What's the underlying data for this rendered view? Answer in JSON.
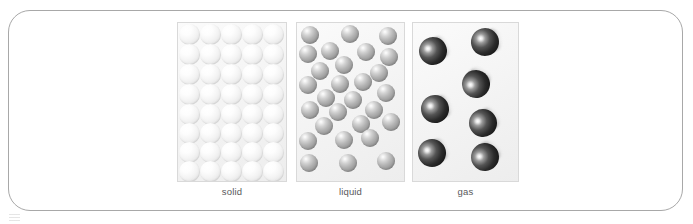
{
  "figure": {
    "frame": {
      "border_color": "#a8a8a8",
      "background_color": "#ffffff",
      "corner_radius_px": 22
    }
  },
  "panels": [
    {
      "id": "solid",
      "label": "solid",
      "state": "solid",
      "particle_color": "#ededed",
      "particle_count": 40,
      "arrangement": "regular close-packed lattice, 5 columns by 8 rows",
      "particle_diameter_px": 21,
      "motion": "vibrating in fixed positions",
      "particles": [
        {
          "x": 1,
          "y": 1
        },
        {
          "x": 22,
          "y": 1
        },
        {
          "x": 43,
          "y": 1
        },
        {
          "x": 64,
          "y": 1
        },
        {
          "x": 85,
          "y": 1
        },
        {
          "x": 1,
          "y": 21
        },
        {
          "x": 22,
          "y": 21
        },
        {
          "x": 43,
          "y": 21
        },
        {
          "x": 64,
          "y": 21
        },
        {
          "x": 85,
          "y": 21
        },
        {
          "x": 1,
          "y": 41
        },
        {
          "x": 22,
          "y": 41
        },
        {
          "x": 43,
          "y": 41
        },
        {
          "x": 64,
          "y": 41
        },
        {
          "x": 85,
          "y": 41
        },
        {
          "x": 1,
          "y": 61
        },
        {
          "x": 22,
          "y": 61
        },
        {
          "x": 43,
          "y": 61
        },
        {
          "x": 64,
          "y": 61
        },
        {
          "x": 85,
          "y": 61
        },
        {
          "x": 1,
          "y": 81
        },
        {
          "x": 22,
          "y": 81
        },
        {
          "x": 43,
          "y": 81
        },
        {
          "x": 64,
          "y": 81
        },
        {
          "x": 85,
          "y": 81
        },
        {
          "x": 1,
          "y": 100
        },
        {
          "x": 22,
          "y": 100
        },
        {
          "x": 43,
          "y": 100
        },
        {
          "x": 64,
          "y": 100
        },
        {
          "x": 85,
          "y": 100
        },
        {
          "x": 1,
          "y": 119
        },
        {
          "x": 22,
          "y": 119
        },
        {
          "x": 43,
          "y": 119
        },
        {
          "x": 64,
          "y": 119
        },
        {
          "x": 85,
          "y": 119
        },
        {
          "x": 1,
          "y": 138
        },
        {
          "x": 22,
          "y": 138
        },
        {
          "x": 43,
          "y": 138
        },
        {
          "x": 64,
          "y": 138
        },
        {
          "x": 85,
          "y": 138
        }
      ]
    },
    {
      "id": "liquid",
      "label": "liquid",
      "state": "liquid",
      "particle_color": "#a0a0a0",
      "particle_count": 28,
      "arrangement": "close together but irregular and disordered",
      "particle_diameter_px": 18,
      "motion": "sliding past one another",
      "particles": [
        {
          "x": 4,
          "y": 3
        },
        {
          "x": 44,
          "y": 2
        },
        {
          "x": 82,
          "y": 4
        },
        {
          "x": 2,
          "y": 22
        },
        {
          "x": 24,
          "y": 19
        },
        {
          "x": 60,
          "y": 20
        },
        {
          "x": 83,
          "y": 25
        },
        {
          "x": 38,
          "y": 33
        },
        {
          "x": 14,
          "y": 39
        },
        {
          "x": 73,
          "y": 41
        },
        {
          "x": 2,
          "y": 53
        },
        {
          "x": 34,
          "y": 52
        },
        {
          "x": 57,
          "y": 50
        },
        {
          "x": 20,
          "y": 66
        },
        {
          "x": 80,
          "y": 61
        },
        {
          "x": 47,
          "y": 68
        },
        {
          "x": 4,
          "y": 78
        },
        {
          "x": 32,
          "y": 80
        },
        {
          "x": 68,
          "y": 78
        },
        {
          "x": 18,
          "y": 94
        },
        {
          "x": 55,
          "y": 92
        },
        {
          "x": 85,
          "y": 90
        },
        {
          "x": 2,
          "y": 109
        },
        {
          "x": 38,
          "y": 108
        },
        {
          "x": 64,
          "y": 106
        },
        {
          "x": 3,
          "y": 131
        },
        {
          "x": 42,
          "y": 131
        },
        {
          "x": 80,
          "y": 129
        }
      ]
    },
    {
      "id": "gas",
      "label": "gas",
      "state": "gas",
      "particle_color": "#1d1d1d",
      "particle_count": 7,
      "arrangement": "far apart, randomly scattered with motion blur",
      "particle_diameter_px": 28,
      "motion": "moving rapidly in all directions",
      "particles": [
        {
          "x": 6,
          "y": 14,
          "rot": -28
        },
        {
          "x": 58,
          "y": 5,
          "rot": -14
        },
        {
          "x": 49,
          "y": 47,
          "rot": -62
        },
        {
          "x": 8,
          "y": 72,
          "rot": -20
        },
        {
          "x": 56,
          "y": 86,
          "rot": -34
        },
        {
          "x": 5,
          "y": 116,
          "rot": -24
        },
        {
          "x": 58,
          "y": 120,
          "rot": -48
        }
      ]
    }
  ]
}
